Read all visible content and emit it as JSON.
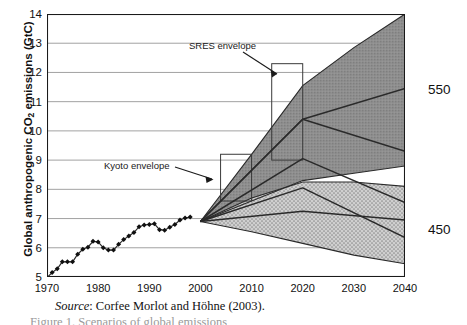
{
  "chart_data": {
    "type": "area",
    "title": "",
    "xlabel": "",
    "ylabel_prefix": "Global anthropogenic CO",
    "ylabel_sub": "2",
    "ylabel_suffix": " emissions (GtC)",
    "ylabel_full": "Global anthropogenic CO2 emissions (GtC)",
    "xlim": [
      1970,
      2040
    ],
    "ylim": [
      5,
      14
    ],
    "xticks": [
      1970,
      1980,
      1990,
      2000,
      2010,
      2020,
      2030,
      2040
    ],
    "yticks": [
      5,
      6,
      7,
      8,
      9,
      10,
      11,
      12,
      13,
      14
    ],
    "grid": "horizontal",
    "legend_position": "right-outside",
    "annotations": [
      {
        "name": "sres-envelope",
        "text": "SRES envelope",
        "x": 2007.5,
        "y": 12.9
      },
      {
        "name": "kyoto-envelope",
        "text": "Kyoto envelope",
        "x": 1981.5,
        "y": 8.6
      }
    ],
    "right_labels": [
      {
        "name": "scenario-550",
        "text": "550",
        "y": 11.1
      },
      {
        "name": "scenario-450",
        "text": "450",
        "y": 6.3
      }
    ],
    "series": [
      {
        "name": "Historical emissions",
        "type": "scatter-line",
        "marker": "diamond",
        "x": [
          1970,
          1971,
          1972,
          1973,
          1974,
          1975,
          1976,
          1977,
          1978,
          1979,
          1980,
          1981,
          1982,
          1983,
          1984,
          1985,
          1986,
          1987,
          1988,
          1989,
          1990,
          1991,
          1992,
          1993,
          1994,
          1995,
          1996,
          1997,
          1998
        ],
        "values": [
          4.98,
          5.15,
          5.28,
          5.52,
          5.52,
          5.52,
          5.78,
          5.95,
          6.02,
          6.22,
          6.2,
          6.0,
          5.92,
          5.92,
          6.12,
          6.28,
          6.4,
          6.52,
          6.72,
          6.78,
          6.8,
          6.82,
          6.62,
          6.6,
          6.7,
          6.8,
          6.95,
          7.02,
          7.05
        ]
      },
      {
        "name": "SRES envelope upper bound",
        "type": "boundary",
        "x": [
          2000,
          2010,
          2020,
          2030,
          2040
        ],
        "values": [
          6.9,
          9.2,
          11.55,
          12.85,
          14.0
        ]
      },
      {
        "name": "SRES envelope lower bound",
        "type": "boundary",
        "x": [
          2000,
          2010,
          2020,
          2030,
          2040
        ],
        "values": [
          6.9,
          7.6,
          8.3,
          8.55,
          8.8
        ]
      },
      {
        "name": "Kyoto / 450 envelope upper bound",
        "type": "boundary",
        "x": [
          2000,
          2010,
          2020,
          2030,
          2040
        ],
        "values": [
          6.9,
          7.7,
          8.25,
          8.25,
          8.1
        ]
      },
      {
        "name": "Kyoto / 450 envelope lower bound",
        "type": "boundary",
        "x": [
          2000,
          2010,
          2020,
          2030,
          2040
        ],
        "values": [
          6.9,
          6.55,
          6.15,
          5.75,
          5.45
        ]
      },
      {
        "name": "550 stabilisation path",
        "type": "line",
        "x": [
          2000,
          2020,
          2040
        ],
        "values": [
          6.9,
          10.4,
          11.45
        ]
      },
      {
        "name": "Mid scenario path A",
        "type": "line",
        "x": [
          2000,
          2020,
          2040
        ],
        "values": [
          6.9,
          10.4,
          9.3
        ]
      },
      {
        "name": "Mid scenario path B",
        "type": "line",
        "x": [
          2000,
          2020,
          2040
        ],
        "values": [
          6.9,
          9.05,
          7.55
        ]
      },
      {
        "name": "450 stabilisation path",
        "type": "line",
        "x": [
          2000,
          2020,
          2040
        ],
        "values": [
          6.9,
          8.05,
          6.35
        ]
      },
      {
        "name": "Lower scenario path",
        "type": "line",
        "x": [
          2000,
          2020,
          2040
        ],
        "values": [
          6.9,
          7.25,
          6.95
        ]
      }
    ],
    "marker_boxes": [
      {
        "name": "range-box-2010",
        "x": 2010,
        "y_low": 7.6,
        "y_high": 9.2
      },
      {
        "name": "range-box-2020",
        "x": 2020,
        "y_low": 9.0,
        "y_high": 12.3
      }
    ],
    "colors": {
      "sres_fill": "#8c8c8c",
      "kyoto_fill": "#c2c2c2",
      "line": "#2a2a2a",
      "grid": "#8a8a8a",
      "axis": "#1a1a1a",
      "marker": "#101010"
    }
  },
  "source": {
    "prefix": "Source",
    "text": ": Corfee Morlot and Höhne (2003)."
  },
  "caption": {
    "text": "Figure 1. Scenarios of global emissions"
  }
}
